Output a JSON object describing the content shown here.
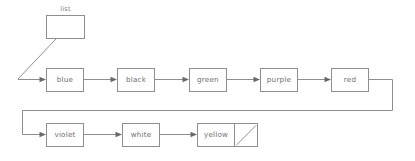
{
  "diagram": {
    "type": "linked-list",
    "title_label": "list",
    "colors": {
      "background": "#ffffff",
      "stroke": "#8e8e8e",
      "text": "#6e6e6e",
      "arrow": "#6a6a6a"
    },
    "head": {
      "label": "list",
      "box": {
        "x": 46,
        "y": 15,
        "w": 39,
        "h": 24
      },
      "label_pos": {
        "x": 65.5,
        "y": 9
      },
      "pointer_line": {
        "x1": 72,
        "y1": 22,
        "x2": 18,
        "y2": 79
      }
    },
    "rows": [
      {
        "name": "row-top",
        "y": 80,
        "nodes": [
          {
            "label": "blue",
            "x": 46,
            "y": 68,
            "w": 38,
            "h": 24
          },
          {
            "label": "black",
            "x": 117,
            "y": 68,
            "w": 38,
            "h": 24
          },
          {
            "label": "green",
            "x": 189,
            "y": 68,
            "w": 38,
            "h": 24
          },
          {
            "label": "purple",
            "x": 260,
            "y": 68,
            "w": 38,
            "h": 24
          },
          {
            "label": "red",
            "x": 331,
            "y": 68,
            "w": 38,
            "h": 24
          }
        ]
      },
      {
        "name": "row-bottom",
        "y": 135,
        "nodes": [
          {
            "label": "violet",
            "x": 46,
            "y": 123,
            "w": 38,
            "h": 24
          },
          {
            "label": "white",
            "x": 122,
            "y": 123,
            "w": 38,
            "h": 24
          },
          {
            "label": "yellow",
            "x": 197,
            "y": 123,
            "w": 38,
            "h": 24
          }
        ]
      }
    ],
    "terminator": {
      "name": "null-pointer",
      "box": {
        "x": 235,
        "y": 123,
        "w": 24,
        "h": 24
      },
      "slash": {
        "x1": 237,
        "y1": 145,
        "x2": 257,
        "y2": 125
      }
    },
    "wrap_wire": {
      "from_x": 369,
      "from_y": 80,
      "corner_right_x": 393,
      "mid_y": 110,
      "corner_left_x": 22,
      "to_y": 135,
      "to_x": 46
    },
    "connections": [
      {
        "from": "list",
        "to": "blue",
        "kind": "pointer-diagonal"
      },
      {
        "from": "blue",
        "to": "black",
        "kind": "arrow"
      },
      {
        "from": "black",
        "to": "green",
        "kind": "arrow"
      },
      {
        "from": "green",
        "to": "purple",
        "kind": "arrow"
      },
      {
        "from": "purple",
        "to": "red",
        "kind": "arrow"
      },
      {
        "from": "red",
        "to": "violet",
        "kind": "wrap-arrow"
      },
      {
        "from": "violet",
        "to": "white",
        "kind": "arrow"
      },
      {
        "from": "white",
        "to": "yellow",
        "kind": "arrow"
      },
      {
        "from": "yellow",
        "to": "null",
        "kind": "terminator"
      }
    ]
  }
}
